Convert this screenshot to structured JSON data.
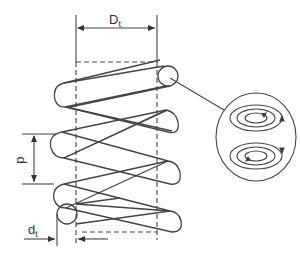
{
  "diagram": {
    "labels": {
      "outer_diameter": "D",
      "outer_diameter_sub": "t",
      "pitch": "p",
      "wire_diameter": "d",
      "wire_diameter_sub": "t"
    },
    "detail_view": {
      "description": "Cross-section of wire showing circulating current loops",
      "loops": 2
    },
    "colors": {
      "stroke": "#444444",
      "background": "#ffffff"
    }
  }
}
